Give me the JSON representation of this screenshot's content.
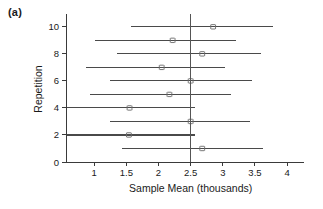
{
  "figure": {
    "panel_label": "(a)",
    "background_color": "#ffffff",
    "line_color": "#4a4a4a",
    "axis_color": "#3a3a3a",
    "reference_line_color": "#555555"
  },
  "chart_data": {
    "type": "scatter",
    "title": "",
    "subtitle": "",
    "xlabel": "Sample Mean (thousands)",
    "ylabel": "Repetition",
    "xlim": [
      0.5,
      4.2
    ],
    "ylim": [
      0,
      10.8
    ],
    "xticks": [
      1,
      1.5,
      2,
      2.5,
      3,
      3.5,
      4
    ],
    "xticklabels": [
      "1",
      "1.5",
      "2",
      "2.5",
      "3",
      "3.5",
      "4"
    ],
    "yticks": [
      0,
      2,
      4,
      6,
      8,
      10
    ],
    "yticklabels": [
      "0",
      "2",
      "4",
      "6",
      "8",
      "10"
    ],
    "grid": false,
    "legend": null,
    "annotations": [
      {
        "type": "vertical_reference_line",
        "x": 2.5,
        "label": "true mean"
      }
    ],
    "series": [
      {
        "name": "95% confidence intervals for sample mean",
        "orientation": "horizontal",
        "x": "Sample Mean (thousands)",
        "y": "Repetition",
        "points": [
          {
            "repetition": 10,
            "mean": 2.85,
            "lower": 1.58,
            "upper": 3.78,
            "contains_true_mean": true
          },
          {
            "repetition": 9,
            "mean": 2.22,
            "lower": 1.01,
            "upper": 3.21,
            "contains_true_mean": true
          },
          {
            "repetition": 8,
            "mean": 2.68,
            "lower": 1.36,
            "upper": 3.6,
            "contains_true_mean": true
          },
          {
            "repetition": 7,
            "mean": 2.05,
            "lower": 0.88,
            "upper": 3.04,
            "contains_true_mean": true
          },
          {
            "repetition": 6,
            "mean": 2.5,
            "lower": 1.24,
            "upper": 3.45,
            "contains_true_mean": true
          },
          {
            "repetition": 5,
            "mean": 2.17,
            "lower": 0.93,
            "upper": 3.12,
            "contains_true_mean": true
          },
          {
            "repetition": 4,
            "mean": 1.55,
            "lower": 0.56,
            "upper": 2.57,
            "contains_true_mean": true
          },
          {
            "repetition": 3,
            "mean": 2.5,
            "lower": 1.24,
            "upper": 3.42,
            "contains_true_mean": true
          },
          {
            "repetition": 2,
            "mean": 1.54,
            "lower": 0.56,
            "upper": 2.57,
            "contains_true_mean": true
          },
          {
            "repetition": 1,
            "mean": 2.68,
            "lower": 1.43,
            "upper": 3.62,
            "contains_true_mean": true
          }
        ]
      }
    ]
  }
}
